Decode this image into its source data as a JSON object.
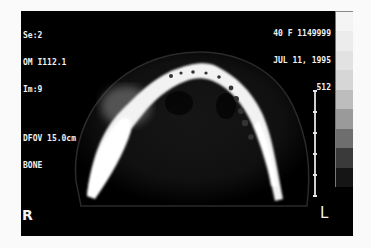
{
  "viewer": {
    "top_left": {
      "series": "Se:2",
      "om": "OM I112.1",
      "image": "Im:9",
      "dfov": "DFOV 15.0cm",
      "window": "BONE"
    },
    "top_right": {
      "patient": "40 F 1149999",
      "date": "JUL 11, 1995",
      "matrix": "512"
    },
    "orientation": {
      "right": "R",
      "left": "L"
    },
    "scale_bar": {
      "ticks": 6
    },
    "gray_scale": {
      "steps": [
        "#f4f4f4",
        "#ececec",
        "#e2e2e2",
        "#d6d6d6",
        "#bdbdbd",
        "#9a9a9a",
        "#6e6e6e",
        "#3a3a3a",
        "#151515"
      ]
    },
    "image": {
      "modality": "CT",
      "description": "axial CT slice of mandible, bone window"
    }
  }
}
